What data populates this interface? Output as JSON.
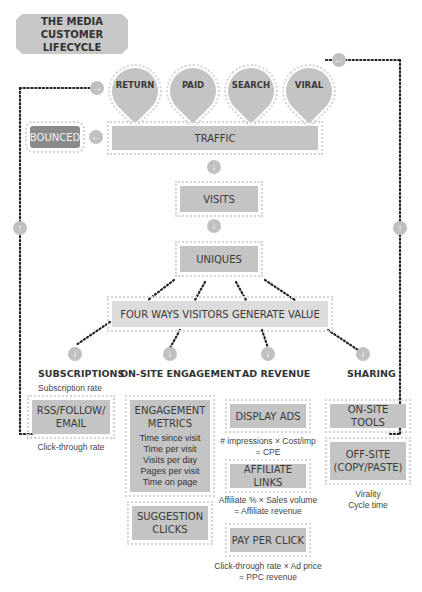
{
  "title": {
    "line1": "THE MEDIA",
    "line2": "CUSTOMER LIFECYCLE"
  },
  "sources": [
    {
      "label": "RETURN"
    },
    {
      "label": "PAID"
    },
    {
      "label": "SEARCH"
    },
    {
      "label": "VIRAL"
    }
  ],
  "funnel": {
    "bounced": "BOUNCED",
    "traffic": "TRAFFIC",
    "visits": "VISITS",
    "uniques": "UNIQUES",
    "value": "FOUR WAYS VISITORS GENERATE VALUE"
  },
  "categories": {
    "subscriptions": {
      "label": "SUBSCRIPTIONS",
      "note_top": "Subscription rate",
      "box": {
        "line1": "RSS/FOLLOW/",
        "line2": "EMAIL"
      },
      "note_bottom": "Click-through rate"
    },
    "engagement": {
      "label": "ON-SITE ENGAGEMENT",
      "metrics_box": {
        "line1": "ENGAGEMENT",
        "line2": "METRICS",
        "items": [
          "Time since visit",
          "Time per visit",
          "Visits per day",
          "Pages per visit",
          "Time on page"
        ]
      },
      "suggestion_box": {
        "line1": "SUGGESTION",
        "line2": "CLICKS"
      }
    },
    "ad_revenue": {
      "label": "AD REVENUE",
      "display_ads": "DISPLAY ADS",
      "display_note": {
        "line1": "# impressions × Cost/imp",
        "line2": "= CPE"
      },
      "affiliate": "AFFILIATE LINKS",
      "affiliate_note": {
        "line1": "Affiliate % × Sales volume",
        "line2": "= Affiliate revenue"
      },
      "ppc": "PAY PER CLICK",
      "ppc_note": {
        "line1": "Click-through rate × Ad price",
        "line2": "= PPC revenue"
      }
    },
    "sharing": {
      "label": "SHARING",
      "onsite": "ON-SITE TOOLS",
      "offsite": {
        "line1": "OFF-SITE",
        "line2": "(COPY/PASTE)"
      },
      "note": {
        "line1": "Virality",
        "line2": "Cycle time"
      }
    }
  },
  "icons": {
    "arrow_right": "→",
    "arrow_left": "←",
    "arrow_down": "↓",
    "arrow_up": "↑"
  },
  "colors": {
    "box_fill": "#c4c4c4",
    "box_light": "#dcdcdc",
    "bounced_fill": "#8a8a8a",
    "dotted_line": "#222222",
    "icon_circle": "#c0c0c0"
  }
}
